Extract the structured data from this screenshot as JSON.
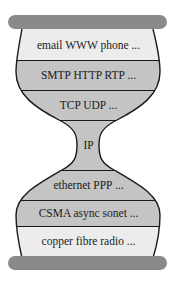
{
  "diagram": {
    "type": "hourglass protocol stack",
    "colors": {
      "bar": "#8a8a8a",
      "light_band": "#ececec",
      "gray_band": "#c4c4c4",
      "outline": "#1a1a1a",
      "text": "#1a1a1a"
    },
    "layers": [
      {
        "label": "email WWW phone ...",
        "shade": "light"
      },
      {
        "label": "SMTP HTTP RTP ...",
        "shade": "gray"
      },
      {
        "label": "TCP UDP ...",
        "shade": "gray"
      },
      {
        "label": "IP",
        "shade": "gray"
      },
      {
        "label": "ethernet PPP ...",
        "shade": "gray"
      },
      {
        "label": "CSMA async sonet ...",
        "shade": "gray"
      },
      {
        "label": "copper fibre radio ...",
        "shade": "light"
      }
    ]
  }
}
